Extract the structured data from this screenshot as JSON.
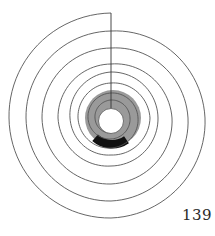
{
  "page": {
    "number": "139"
  },
  "diagram": {
    "type": "spiral",
    "center": [
      111,
      118
    ],
    "stroke_color": "#555555",
    "disk_color": "#9a9a9a",
    "band_color": "#111111",
    "hole_color": "#ffffff",
    "spiral_quarter_radii": [
      105,
      102,
      100,
      94,
      87,
      85,
      83,
      77,
      70,
      69,
      66,
      61,
      54,
      53,
      48,
      47,
      46,
      41,
      37,
      39,
      35,
      33,
      30,
      27,
      25,
      23,
      21,
      19,
      18,
      16,
      15
    ],
    "radial_line": {
      "x": 111,
      "y1": 13,
      "y2": 108
    },
    "disk": {
      "cx": 113,
      "cy": 118,
      "r": 28
    },
    "hole": {
      "cx": 111,
      "cy": 121,
      "r": 12.5
    },
    "band": {
      "cx": 112,
      "cy": 119,
      "r_inner": 21,
      "r_outer": 29.5,
      "start_deg": 55,
      "end_deg": 132
    }
  }
}
